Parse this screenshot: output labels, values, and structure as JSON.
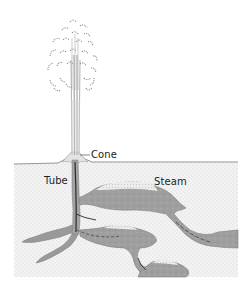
{
  "diagram": {
    "labels": {
      "cone": "Cone",
      "tube": "Tube",
      "steam": "Steam"
    },
    "colors": {
      "background": "#ffffff",
      "ground_fill": "#f2f2f2",
      "ground_stipple": "#b8b8b8",
      "chamber_fill": "#9e9e9e",
      "chamber_edge": "#7a7a7a",
      "steam_fill": "#e6e6e6",
      "tube_dark": "#2a2a2a",
      "spray": "#8a8a8a",
      "label_text": "#222222"
    }
  }
}
